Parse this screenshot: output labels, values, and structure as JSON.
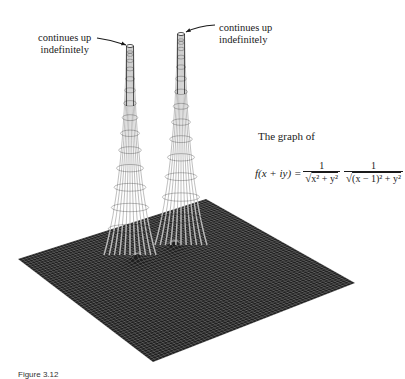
{
  "annotations": {
    "left_peak_label": [
      "continues up",
      "indefinitely"
    ],
    "right_peak_label": [
      "continues up",
      "indefinitely"
    ]
  },
  "caption": "The graph of",
  "formula": {
    "lhs": "f(x + iy) =",
    "frac1": {
      "numerator": "1",
      "denominator": "x² + y²"
    },
    "frac2": {
      "numerator": "1",
      "denominator": "(x − 1)² + y²"
    }
  },
  "figure_caption": "Figure 3.12",
  "surface": {
    "plane_corners": {
      "left": [
        18,
        259
      ],
      "top": [
        206,
        199
      ],
      "right": [
        355,
        283
      ],
      "bottom": [
        153,
        362
      ]
    },
    "peaks": [
      {
        "name": "left-pole",
        "base": [
          130,
          245
        ],
        "tip": [
          130,
          46
        ]
      },
      {
        "name": "right-pole",
        "base": [
          181,
          235
        ],
        "tip": [
          181,
          34
        ]
      }
    ],
    "colors": {
      "plane": "#1e1e1e",
      "mesh": "#f2f2f2",
      "ink": "#1a1a1a"
    }
  }
}
